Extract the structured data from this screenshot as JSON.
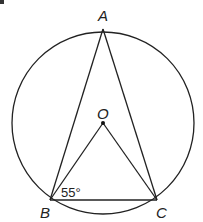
{
  "diagram": {
    "type": "circle-geometry",
    "circle": {
      "center_label": "O"
    },
    "points": {
      "A": {
        "label": "A"
      },
      "B": {
        "label": "B"
      },
      "C": {
        "label": "C"
      },
      "O": {
        "label": "O"
      }
    },
    "segments": [
      "AB",
      "AC",
      "BC",
      "OB",
      "OC"
    ],
    "angle_label": "55°",
    "angle_at": "OBC",
    "stroke_color": "#222222"
  }
}
